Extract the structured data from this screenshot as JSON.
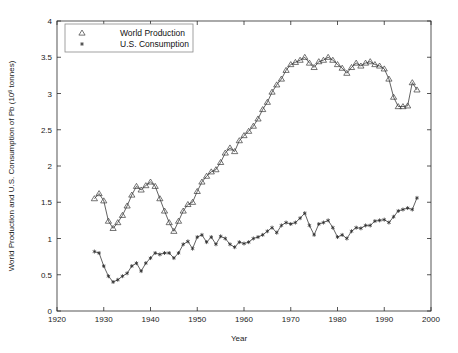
{
  "figure": {
    "background_color": "#ffffff",
    "line_color": "#3a3a3a",
    "axis_color": "#2b2b2b"
  },
  "axes": {
    "xlabel": "Year",
    "ylabel_main": "World Production and U.S. Consumption of Pb (10",
    "ylabel_exp": "6",
    "ylabel_tail": " tonnes)",
    "x_ticks": [
      "1920",
      "1930",
      "1940",
      "1950",
      "1960",
      "1970",
      "1980",
      "1990",
      "2000"
    ],
    "y_ticks": [
      "0",
      "0.5",
      "1",
      "1.5",
      "2",
      "2.5",
      "3",
      "3.5",
      "4"
    ]
  },
  "legend": {
    "entries": [
      {
        "marker": "triangle-marker",
        "label": "World Production"
      },
      {
        "marker": "star-marker",
        "label": "U.S. Consumption"
      }
    ]
  },
  "chart_data": {
    "type": "line",
    "title": "",
    "xlabel": "Year",
    "ylabel": "World Production and U.S. Consumption of Pb (10^6 tonnes)",
    "xlim": [
      1920,
      2000
    ],
    "ylim": [
      0,
      4
    ],
    "xtick_step": 10,
    "ytick_step": 0.5,
    "grid": false,
    "legend_position": "top-left-inside",
    "series": [
      {
        "name": "World Production",
        "marker": "triangle",
        "x": [
          1928,
          1929,
          1930,
          1931,
          1932,
          1933,
          1934,
          1935,
          1936,
          1937,
          1938,
          1939,
          1940,
          1941,
          1942,
          1943,
          1944,
          1945,
          1946,
          1947,
          1948,
          1949,
          1950,
          1951,
          1952,
          1953,
          1954,
          1955,
          1956,
          1957,
          1958,
          1959,
          1960,
          1961,
          1962,
          1963,
          1964,
          1965,
          1966,
          1967,
          1968,
          1969,
          1970,
          1971,
          1972,
          1973,
          1974,
          1975,
          1976,
          1977,
          1978,
          1979,
          1980,
          1981,
          1982,
          1983,
          1984,
          1985,
          1986,
          1987,
          1988,
          1989,
          1990,
          1991,
          1992,
          1993,
          1994,
          1995,
          1996,
          1997
        ],
        "y": [
          1.55,
          1.62,
          1.52,
          1.24,
          1.14,
          1.22,
          1.32,
          1.45,
          1.6,
          1.72,
          1.67,
          1.73,
          1.78,
          1.72,
          1.55,
          1.38,
          1.22,
          1.1,
          1.24,
          1.38,
          1.47,
          1.5,
          1.65,
          1.78,
          1.86,
          1.92,
          1.95,
          2.05,
          2.18,
          2.25,
          2.2,
          2.35,
          2.42,
          2.48,
          2.55,
          2.65,
          2.78,
          2.88,
          3.02,
          3.12,
          3.2,
          3.32,
          3.4,
          3.43,
          3.46,
          3.5,
          3.42,
          3.36,
          3.44,
          3.46,
          3.5,
          3.46,
          3.4,
          3.35,
          3.28,
          3.36,
          3.42,
          3.38,
          3.42,
          3.44,
          3.4,
          3.38,
          3.34,
          3.2,
          2.95,
          2.82,
          2.82,
          2.83,
          3.15,
          3.05
        ]
      },
      {
        "name": "U.S. Consumption",
        "marker": "star",
        "x": [
          1928,
          1929,
          1930,
          1931,
          1932,
          1933,
          1934,
          1935,
          1936,
          1937,
          1938,
          1939,
          1940,
          1941,
          1942,
          1943,
          1944,
          1945,
          1946,
          1947,
          1948,
          1949,
          1950,
          1951,
          1952,
          1953,
          1954,
          1955,
          1956,
          1957,
          1958,
          1959,
          1960,
          1961,
          1962,
          1963,
          1964,
          1965,
          1966,
          1967,
          1968,
          1969,
          1970,
          1971,
          1972,
          1973,
          1974,
          1975,
          1976,
          1977,
          1978,
          1979,
          1980,
          1981,
          1982,
          1983,
          1984,
          1985,
          1986,
          1987,
          1988,
          1989,
          1990,
          1991,
          1992,
          1993,
          1994,
          1995,
          1996,
          1997
        ],
        "y": [
          0.82,
          0.8,
          0.62,
          0.48,
          0.4,
          0.43,
          0.48,
          0.52,
          0.62,
          0.66,
          0.55,
          0.66,
          0.73,
          0.8,
          0.78,
          0.8,
          0.8,
          0.73,
          0.8,
          0.92,
          0.96,
          0.86,
          1.02,
          1.05,
          0.95,
          1.02,
          0.92,
          1.03,
          1.0,
          0.92,
          0.88,
          0.95,
          0.93,
          0.95,
          1.0,
          1.02,
          1.05,
          1.1,
          1.15,
          1.08,
          1.18,
          1.22,
          1.2,
          1.22,
          1.28,
          1.35,
          1.18,
          1.05,
          1.2,
          1.22,
          1.25,
          1.15,
          1.02,
          1.05,
          1.0,
          1.1,
          1.15,
          1.14,
          1.18,
          1.18,
          1.24,
          1.25,
          1.26,
          1.22,
          1.3,
          1.38,
          1.4,
          1.42,
          1.4,
          1.56
        ]
      }
    ]
  }
}
